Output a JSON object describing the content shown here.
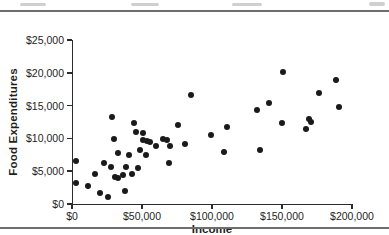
{
  "figure": {
    "background": "#ffffff",
    "divider_color": "#6e6e6e"
  },
  "colors": {
    "marker": "#1a1a1a",
    "axis": "#2b2b2b",
    "tick_text": "#242424",
    "axis_title_text": "#1f1f1f"
  },
  "chart_data": {
    "type": "scatter",
    "title": "",
    "xlabel": "Income",
    "ylabel": "Food Expenditures",
    "xlim": [
      0,
      200000
    ],
    "ylim": [
      0,
      25000
    ],
    "grid": false,
    "legend": "none",
    "marker": {
      "shape": "circle",
      "color": "#1a1a1a",
      "size_px": 6
    },
    "x_ticks": [
      {
        "value": 0,
        "label": "$0"
      },
      {
        "value": 50000,
        "label": "$50,000"
      },
      {
        "value": 100000,
        "label": "$100,000"
      },
      {
        "value": 150000,
        "label": "$150,000"
      },
      {
        "value": 200000,
        "label": "$200,000"
      }
    ],
    "y_ticks": [
      {
        "value": 0,
        "label": "$0"
      },
      {
        "value": 5000,
        "label": "$5,000"
      },
      {
        "value": 10000,
        "label": "$10,000"
      },
      {
        "value": 15000,
        "label": "$15,000"
      },
      {
        "value": 20000,
        "label": "$20,000"
      },
      {
        "value": 25000,
        "label": "$25,000"
      }
    ],
    "series_fields": [
      "income",
      "food_expenditures"
    ],
    "points": [
      [
        2500,
        6600
      ],
      [
        3000,
        3200
      ],
      [
        11500,
        2800
      ],
      [
        16500,
        4500
      ],
      [
        20000,
        1700
      ],
      [
        22500,
        6200
      ],
      [
        25500,
        1000
      ],
      [
        28000,
        5700
      ],
      [
        28500,
        13200
      ],
      [
        30000,
        9900
      ],
      [
        30500,
        4100
      ],
      [
        32500,
        4000
      ],
      [
        33000,
        7700
      ],
      [
        36500,
        4400
      ],
      [
        38000,
        2000
      ],
      [
        38500,
        5600
      ],
      [
        40500,
        7400
      ],
      [
        42500,
        4600
      ],
      [
        44000,
        12300
      ],
      [
        46000,
        10900
      ],
      [
        47000,
        5500
      ],
      [
        48500,
        8200
      ],
      [
        50500,
        9700
      ],
      [
        51000,
        10800
      ],
      [
        52500,
        7400
      ],
      [
        53500,
        9600
      ],
      [
        56000,
        9500
      ],
      [
        60000,
        8900
      ],
      [
        65000,
        9900
      ],
      [
        68000,
        9700
      ],
      [
        69000,
        6300
      ],
      [
        70000,
        8800
      ],
      [
        75500,
        12000
      ],
      [
        81000,
        9200
      ],
      [
        85000,
        16600
      ],
      [
        99000,
        10500
      ],
      [
        108500,
        7900
      ],
      [
        110500,
        11800
      ],
      [
        132000,
        14400
      ],
      [
        134000,
        8300
      ],
      [
        141000,
        15400
      ],
      [
        150000,
        12300
      ],
      [
        151000,
        20100
      ],
      [
        167000,
        11500
      ],
      [
        169000,
        12900
      ],
      [
        171000,
        12500
      ],
      [
        176500,
        16900
      ],
      [
        188500,
        18900
      ],
      [
        191000,
        14800
      ]
    ]
  }
}
